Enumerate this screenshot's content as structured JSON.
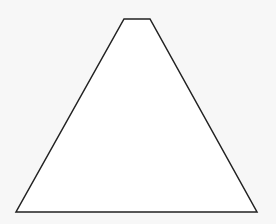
{
  "canvas": {
    "width": 276,
    "height": 224,
    "background": "#f7f7f7"
  },
  "shape": {
    "type": "trapezoid",
    "stroke": "#222222",
    "fill": "#ffffff",
    "stroke_width": 1.5,
    "points": [
      [
        124,
        19
      ],
      [
        150,
        19
      ],
      [
        257,
        212
      ],
      [
        16,
        212
      ]
    ]
  }
}
